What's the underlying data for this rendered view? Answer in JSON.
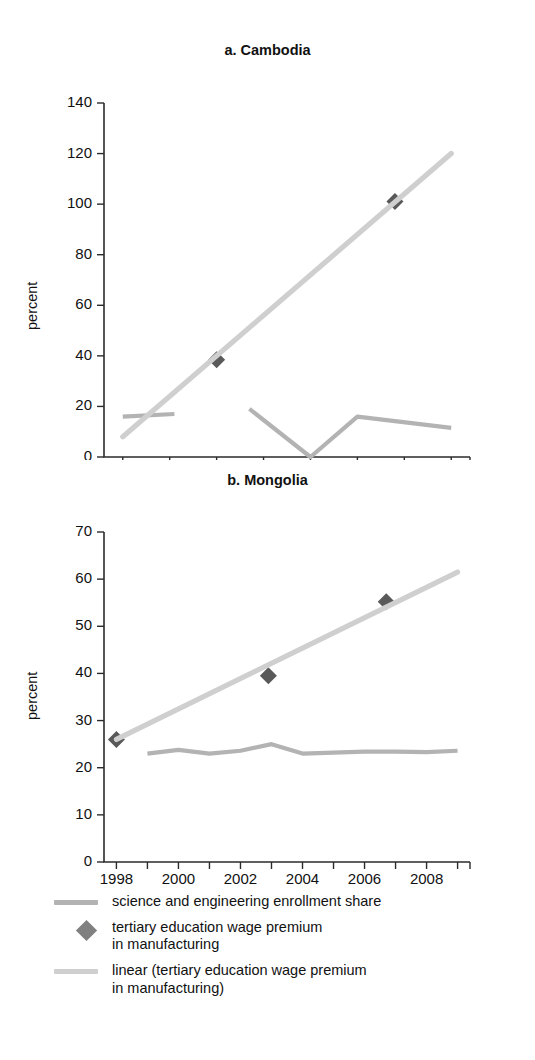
{
  "figure": {
    "title": "",
    "ylabel": "percent"
  },
  "legend": [
    {
      "key": "line-light",
      "lines": [
        "science and engineering enrollment share"
      ]
    },
    {
      "key": "diamond",
      "lines": [
        "tertiary education wage premium",
        "in manufacturing"
      ]
    },
    {
      "key": "line-trend",
      "lines": [
        "linear (tertiary education wage premium",
        "in manufacturing)"
      ]
    }
  ],
  "chart_data": [
    {
      "type": "line",
      "title": "a. Cambodia",
      "xlabel": "",
      "ylabel": "percent",
      "xlim": [
        2000.6,
        2008.4
      ],
      "ylim": [
        0,
        140
      ],
      "yticks": [
        0,
        20,
        40,
        60,
        80,
        100,
        120,
        140
      ],
      "xticks": [
        2001,
        2002,
        2003,
        2004,
        2005,
        2006,
        2007,
        2008
      ],
      "xticklabels": [
        "2001",
        "2002",
        "2003",
        "2004",
        "2005",
        "2006",
        "2007",
        "2008"
      ],
      "grid": false,
      "legend_position": "below-figure",
      "series": [
        {
          "name": "science and engineering enrollment share",
          "style": "line",
          "color": "#b3b3b3",
          "segments": [
            {
              "x": [
                2001.0,
                2002.1
              ],
              "y": [
                16.0,
                17.0
              ]
            },
            {
              "x": [
                2003.7,
                2005.0,
                2006.0,
                2008.0
              ],
              "y": [
                19.0,
                0.0,
                16.0,
                11.5
              ]
            }
          ]
        },
        {
          "name": "tertiary education wage premium in manufacturing",
          "style": "marker",
          "marker": "diamond",
          "color": "#595959",
          "x": [
            2003.0,
            2006.8
          ],
          "y": [
            38.5,
            101.0
          ]
        },
        {
          "name": "linear (tertiary education wage premium in manufacturing)",
          "style": "trendline",
          "color": "#cfcfcf",
          "x": [
            2001.0,
            2008.0
          ],
          "y": [
            8.0,
            120.0
          ]
        }
      ]
    },
    {
      "type": "line",
      "title": "b. Mongolia",
      "xlabel": "",
      "ylabel": "percent",
      "xlim": [
        1997.6,
        2009.4
      ],
      "ylim": [
        0,
        70
      ],
      "yticks": [
        0,
        10,
        20,
        30,
        40,
        50,
        60,
        70
      ],
      "xticks": [
        1998,
        1999,
        2000,
        2001,
        2002,
        2003,
        2004,
        2005,
        2006,
        2007,
        2008,
        2009
      ],
      "xticklabels": [
        "1998",
        "",
        "2000",
        "",
        "2002",
        "",
        "2004",
        "",
        "2006",
        "",
        "2008",
        ""
      ],
      "grid": false,
      "legend_position": "below-figure",
      "series": [
        {
          "name": "science and engineering enrollment share",
          "style": "line",
          "color": "#b3b3b3",
          "segments": [
            {
              "x": [
                1999.0,
                2000.0,
                2001.0,
                2002.0,
                2003.0,
                2004.0,
                2005.0,
                2006.0,
                2007.0,
                2008.0,
                2009.0
              ],
              "y": [
                23.0,
                23.8,
                23.0,
                23.6,
                25.0,
                23.0,
                23.2,
                23.4,
                23.4,
                23.3,
                23.6
              ]
            }
          ]
        },
        {
          "name": "tertiary education wage premium in manufacturing",
          "style": "marker",
          "marker": "diamond",
          "color": "#595959",
          "x": [
            1998.0,
            2002.9,
            2006.7
          ],
          "y": [
            26.0,
            39.5,
            55.2
          ]
        },
        {
          "name": "linear (tertiary education wage premium in manufacturing)",
          "style": "trendline",
          "color": "#cfcfcf",
          "x": [
            1998.0,
            2009.0
          ],
          "y": [
            26.0,
            61.5
          ]
        }
      ]
    }
  ]
}
